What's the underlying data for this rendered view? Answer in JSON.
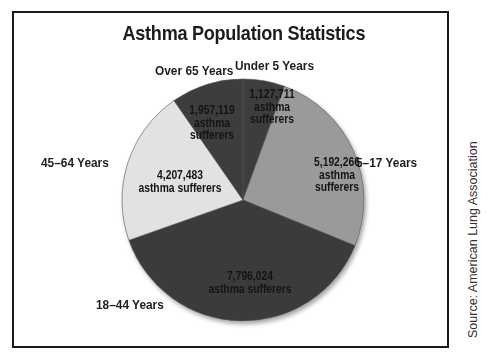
{
  "chart_data": {
    "type": "pie",
    "title": "Asthma Population Statistics",
    "categories": [
      "Under 5 Years",
      "5–17 Years",
      "18–44 Years",
      "45–64 Years",
      "Over 65 Years"
    ],
    "values": [
      1127711,
      5192266,
      7796024,
      4207483,
      1957119
    ],
    "value_labels": [
      "1,127,711",
      "5,192,266",
      "7,796,024",
      "4,207,483",
      "1,957,119"
    ],
    "value_suffix": "asthma sufferers",
    "slice_colors": [
      "#3c3c3c",
      "#9a9a9a",
      "#3a3a3a",
      "#e2e2e2",
      "#3c3c3c"
    ],
    "start_angle_deg": 0,
    "direction": "clockwise",
    "legend": "none (direct labels)",
    "source": "Source: American Lung Association"
  },
  "labels": {
    "under5": {
      "category": "Under 5 Years",
      "value": "1,127,711",
      "line1": "asthma",
      "line2": "sufferers"
    },
    "age5_17": {
      "category": "5–17 Years",
      "value": "5,192,266",
      "line1": "asthma",
      "line2": "sufferers"
    },
    "age18_44": {
      "category": "18–44 Years",
      "value": "7,796,024",
      "line1": "asthma sufferers"
    },
    "age45_64": {
      "category": "45–64 Years",
      "value": "4,207,483",
      "line1": "asthma sufferers"
    },
    "over65": {
      "category": "Over 65 Years",
      "value": "1,957,119",
      "line1": "asthma",
      "line2": "sufferers"
    }
  },
  "source": "Source: American Lung Association"
}
